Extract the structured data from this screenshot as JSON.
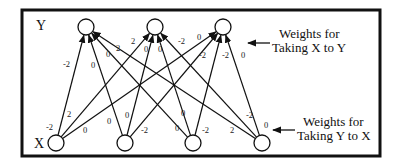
{
  "diagram": {
    "title": "",
    "layer_labels": {
      "top": "Y",
      "bottom": "X"
    },
    "annotations": {
      "x_to_y": {
        "line1": "Weights for",
        "line2": "Taking X to Y"
      },
      "y_to_x": {
        "line1": "Weights for",
        "line2": "Taking Y to X"
      }
    },
    "y_nodes": [
      {
        "id": "y1",
        "cx": 86,
        "cy": 27
      },
      {
        "id": "y2",
        "cx": 155,
        "cy": 27
      },
      {
        "id": "y3",
        "cx": 223,
        "cy": 27
      }
    ],
    "x_nodes": [
      {
        "id": "x1",
        "cx": 56,
        "cy": 143
      },
      {
        "id": "x2",
        "cx": 125,
        "cy": 143
      },
      {
        "id": "x3",
        "cx": 193,
        "cy": 143
      },
      {
        "id": "x4",
        "cx": 262,
        "cy": 143
      }
    ],
    "edges": [
      {
        "from": "x1",
        "to": "y1"
      },
      {
        "from": "x1",
        "to": "y2"
      },
      {
        "from": "x1",
        "to": "y3"
      },
      {
        "from": "x2",
        "to": "y1"
      },
      {
        "from": "x2",
        "to": "y2"
      },
      {
        "from": "x2",
        "to": "y3"
      },
      {
        "from": "x3",
        "to": "y1"
      },
      {
        "from": "x3",
        "to": "y2"
      },
      {
        "from": "x3",
        "to": "y3"
      },
      {
        "from": "x4",
        "to": "y1"
      },
      {
        "from": "x4",
        "to": "y2"
      },
      {
        "from": "x4",
        "to": "y3"
      }
    ],
    "weights_top": [
      {
        "text": "-2",
        "x": 63,
        "y": 67
      },
      {
        "text": "0",
        "x": 91,
        "y": 68
      },
      {
        "text": "0",
        "x": 106,
        "y": 57
      },
      {
        "text": "2",
        "x": 116,
        "y": 51
      },
      {
        "text": "2",
        "x": 131,
        "y": 44
      },
      {
        "text": "0",
        "x": 144,
        "y": 52
      },
      {
        "text": "0",
        "x": 158,
        "y": 52
      },
      {
        "text": "-2",
        "x": 178,
        "y": 44
      },
      {
        "text": "0",
        "x": 197,
        "y": 40
      },
      {
        "text": "-2",
        "x": 199,
        "y": 58
      },
      {
        "text": "-2",
        "x": 222,
        "y": 58
      },
      {
        "text": "0",
        "x": 241,
        "y": 58
      }
    ],
    "weights_bottom": [
      {
        "text": "-2",
        "x": 46,
        "y": 130
      },
      {
        "text": "2",
        "x": 67,
        "y": 117
      },
      {
        "text": "0",
        "x": 83,
        "y": 133
      },
      {
        "text": "0",
        "x": 107,
        "y": 124
      },
      {
        "text": "0",
        "x": 125,
        "y": 118
      },
      {
        "text": "-2",
        "x": 141,
        "y": 133
      },
      {
        "text": "0",
        "x": 175,
        "y": 131
      },
      {
        "text": "0",
        "x": 181,
        "y": 116
      },
      {
        "text": "-2",
        "x": 202,
        "y": 133
      },
      {
        "text": "2",
        "x": 230,
        "y": 133
      },
      {
        "text": "-2",
        "x": 246,
        "y": 118
      },
      {
        "text": "0",
        "x": 264,
        "y": 128
      }
    ]
  }
}
